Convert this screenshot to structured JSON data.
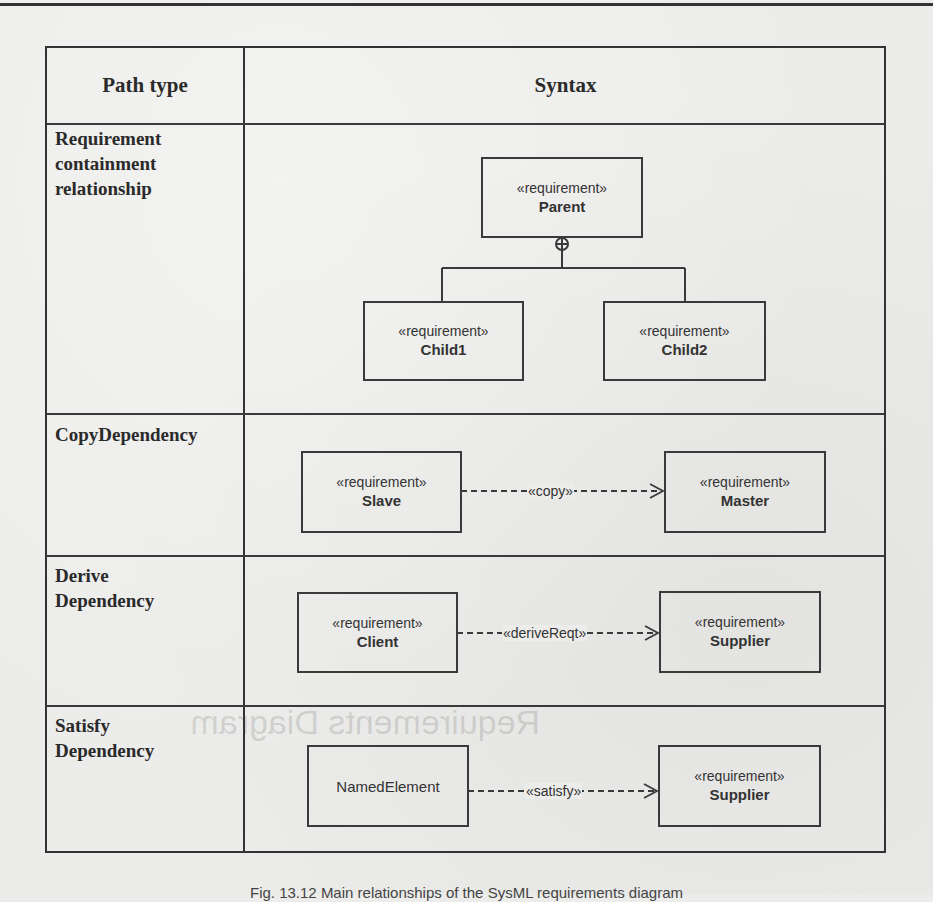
{
  "table": {
    "headers": {
      "path_type": "Path type",
      "syntax": "Syntax"
    },
    "rows": [
      {
        "path_type": "Requirement containment relationship",
        "path_type_lines": [
          "Requirement",
          "containment",
          "relationship"
        ],
        "diagram": {
          "kind": "containment",
          "parent": {
            "stereotype": "«requirement»",
            "name": "Parent"
          },
          "children": [
            {
              "stereotype": "«requirement»",
              "name": "Child1"
            },
            {
              "stereotype": "«requirement»",
              "name": "Child2"
            }
          ],
          "connector_symbol": "⊕"
        }
      },
      {
        "path_type": "CopyDependency",
        "path_type_lines": [
          "CopyDependency"
        ],
        "diagram": {
          "kind": "dependency",
          "source": {
            "stereotype": "«requirement»",
            "name": "Slave"
          },
          "label": "«copy»",
          "target": {
            "stereotype": "«requirement»",
            "name": "Master"
          }
        }
      },
      {
        "path_type": "Derive Dependency",
        "path_type_lines": [
          "Derive",
          "Dependency"
        ],
        "diagram": {
          "kind": "dependency",
          "source": {
            "stereotype": "«requirement»",
            "name": "Client"
          },
          "label": "«deriveReqt»",
          "target": {
            "stereotype": "«requirement»",
            "name": "Supplier"
          }
        }
      },
      {
        "path_type": "Satisfy Dependency",
        "path_type_lines": [
          "Satisfy",
          "Dependency"
        ],
        "diagram": {
          "kind": "dependency",
          "source": {
            "stereotype": "",
            "name": "NamedElement"
          },
          "label": "«satisfy»",
          "target": {
            "stereotype": "«requirement»",
            "name": "Supplier"
          }
        }
      }
    ]
  },
  "ghost_text": {
    "heading": "Requirements Diagram"
  },
  "caption": "Fig. 13.12 Main relationships of the SysML requirements diagram"
}
